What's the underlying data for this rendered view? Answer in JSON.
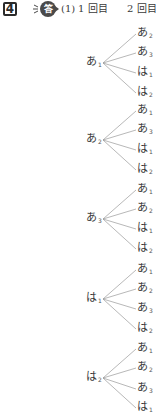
{
  "header": {
    "question_number": "4",
    "answer_badge": "答",
    "part_label": "(1)",
    "column_first": "1回目",
    "column_first_num": "1",
    "column_first_text": "回目",
    "column_second_num": "2",
    "column_second_text": "回目"
  },
  "colors": {
    "text": "#3a3a3a",
    "line": "#9a9a9a",
    "badge": "#4a4a4a"
  },
  "trees": [
    {
      "root": {
        "char": "あ",
        "sub": "1"
      },
      "leaves": [
        {
          "char": "あ",
          "sub": "2"
        },
        {
          "char": "あ",
          "sub": "3"
        },
        {
          "char": "は",
          "sub": "1"
        },
        {
          "char": "は",
          "sub": "2"
        }
      ]
    },
    {
      "root": {
        "char": "あ",
        "sub": "2"
      },
      "leaves": [
        {
          "char": "あ",
          "sub": "1"
        },
        {
          "char": "あ",
          "sub": "3"
        },
        {
          "char": "は",
          "sub": "1"
        },
        {
          "char": "は",
          "sub": "2"
        }
      ]
    },
    {
      "root": {
        "char": "あ",
        "sub": "3"
      },
      "leaves": [
        {
          "char": "あ",
          "sub": "1"
        },
        {
          "char": "あ",
          "sub": "2"
        },
        {
          "char": "は",
          "sub": "1"
        },
        {
          "char": "は",
          "sub": "2"
        }
      ]
    },
    {
      "root": {
        "char": "は",
        "sub": "1"
      },
      "leaves": [
        {
          "char": "あ",
          "sub": "1"
        },
        {
          "char": "あ",
          "sub": "2"
        },
        {
          "char": "あ",
          "sub": "3"
        },
        {
          "char": "は",
          "sub": "2"
        }
      ]
    },
    {
      "root": {
        "char": "は",
        "sub": "2"
      },
      "leaves": [
        {
          "char": "あ",
          "sub": "1"
        },
        {
          "char": "あ",
          "sub": "2"
        },
        {
          "char": "あ",
          "sub": "3"
        },
        {
          "char": "は",
          "sub": "1"
        }
      ]
    }
  ]
}
